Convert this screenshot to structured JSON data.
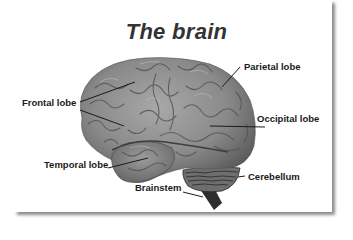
{
  "title": "The brain",
  "labels": {
    "frontal": "Frontal lobe",
    "parietal": "Parietal lobe",
    "occipital": "Occipital lobe",
    "temporal": "Temporal lobe",
    "cerebellum": "Cerebellum",
    "brainstem": "Brainstem"
  },
  "colors": {
    "brain": "#8a8a8a",
    "brain_dark": "#5e5e5e",
    "leader_line": "#1a1a1a",
    "title": "#333333",
    "card_shadow": "#9a9a9a"
  }
}
